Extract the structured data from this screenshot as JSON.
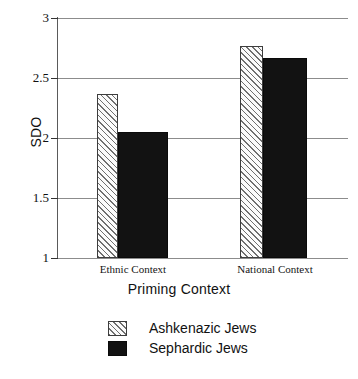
{
  "chart_data": {
    "type": "bar",
    "title": "",
    "subtitle": "",
    "xlabel": "Priming Context",
    "ylabel": "SDO",
    "categories": [
      "Ethnic Context",
      "National Context"
    ],
    "series": [
      {
        "name": "Ashkenazic Jews",
        "values": [
          2.37,
          2.77
        ],
        "fill": "hatched",
        "color": "#fbfbfb"
      },
      {
        "name": "Sephardic Jews",
        "values": [
          2.05,
          2.67
        ],
        "fill": "solid",
        "color": "#121212"
      }
    ],
    "ylim": [
      1,
      3
    ],
    "yticks": [
      "1",
      "1.5",
      "2",
      "2.5",
      "3"
    ],
    "ytick_values": [
      1,
      1.5,
      2,
      2.5,
      3
    ],
    "grid": true,
    "legend_position": "bottom-center",
    "legend_entries": [
      "Ashkenazic Jews",
      "Sephardic Jews"
    ]
  },
  "axes": {
    "y_title": "SDO",
    "x_title": "Priming Context",
    "y_tick_labels": {
      "t0": "3",
      "t1": "2.5",
      "t2": "2",
      "t3": "1.5",
      "t4": "1"
    },
    "x_tick_labels": {
      "c0": "Ethnic Context",
      "c1": "National Context"
    }
  },
  "legend": {
    "rows": [
      {
        "label": "Ashkenazic Jews"
      },
      {
        "label": "Sephardic Jews"
      }
    ]
  }
}
